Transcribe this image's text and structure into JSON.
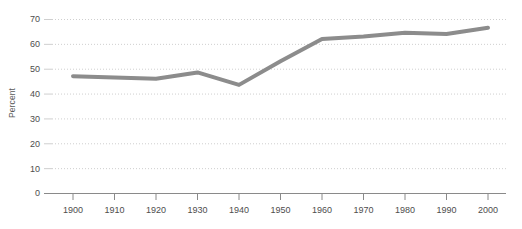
{
  "chart_data": {
    "type": "line",
    "title": "",
    "subtitle": "",
    "xlabel": "",
    "ylabel": "Percent",
    "x": [
      1900,
      1910,
      1920,
      1930,
      1940,
      1950,
      1960,
      1970,
      1980,
      1990,
      2000
    ],
    "categories": [
      "1900",
      "1910",
      "1920",
      "1930",
      "1940",
      "1950",
      "1960",
      "1970",
      "1980",
      "1990",
      "2000"
    ],
    "values": [
      47,
      46.5,
      46,
      48.5,
      43.5,
      53,
      62,
      63,
      64.5,
      64,
      66.5
    ],
    "series": [
      {
        "name": "Percent",
        "values": [
          47,
          46.5,
          46,
          48.5,
          43.5,
          53,
          62,
          63,
          64.5,
          64,
          66.5
        ]
      }
    ],
    "xlim": [
      1895,
      2005
    ],
    "ylim": [
      0,
      72
    ],
    "xticks": [
      1900,
      1910,
      1920,
      1930,
      1940,
      1950,
      1960,
      1970,
      1980,
      1990,
      2000
    ],
    "xtick_labels": [
      "1900",
      "1910",
      "1920",
      "1930",
      "1940",
      "1950",
      "1960",
      "1970",
      "1980",
      "1990",
      "2000"
    ],
    "yticks": [
      0,
      10,
      20,
      30,
      40,
      50,
      60,
      70
    ],
    "ytick_labels": [
      "0",
      "10",
      "20",
      "30",
      "40",
      "50",
      "60",
      "70"
    ],
    "grid": "horizontal-dotted",
    "legend": "none",
    "annotations": [],
    "colors": {
      "line": "#8c8c8c",
      "grid": "#cfcfcf",
      "axis": "#8a8a8a",
      "text": "#4d4d4d",
      "background": "#ffffff"
    },
    "line_width": 4
  }
}
